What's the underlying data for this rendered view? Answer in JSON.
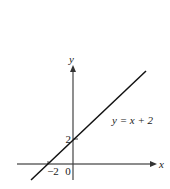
{
  "figure": {
    "equation_label": "y = x + 2",
    "x_axis_label": "x",
    "y_axis_label": "y",
    "y_intercept_label": "2",
    "x_intercept_label": "−2",
    "origin_label": "0"
  },
  "colors": {
    "axis": "#555555",
    "line": "#111111",
    "text": "#222222"
  }
}
